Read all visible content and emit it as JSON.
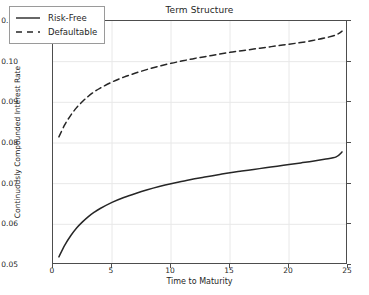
{
  "chart_data": {
    "type": "line",
    "title": "Term Structure",
    "xlabel": "Time to Maturity",
    "ylabel": "Continuously Compounded Interest Rate",
    "xlim": [
      0,
      25
    ],
    "ylim": [
      0.05,
      0.11
    ],
    "xticks": [
      "0",
      "5",
      "10",
      "15",
      "20",
      "25"
    ],
    "xtick_values": [
      0,
      5,
      10,
      15,
      20,
      25
    ],
    "yticks": [
      "0.05",
      "0.06",
      "0.07",
      "0.08",
      "0.09",
      "0.10",
      "0.11"
    ],
    "ytick_values": [
      0.05,
      0.06,
      0.07,
      0.08,
      0.09,
      0.1,
      0.11
    ],
    "grid": true,
    "legend_position": "upper left",
    "x": [
      0.5,
      1,
      1.5,
      2,
      2.5,
      3,
      3.5,
      4,
      5,
      6,
      7,
      8,
      9,
      10,
      11,
      12,
      13,
      14,
      15,
      16,
      17,
      18,
      19,
      20,
      21,
      22,
      23,
      24,
      24.5
    ],
    "series": [
      {
        "name": "Risk-Free",
        "style": "solid",
        "color": "#262626",
        "values": [
          0.052,
          0.0549,
          0.0572,
          0.0591,
          0.0606,
          0.0619,
          0.063,
          0.0639,
          0.0654,
          0.0666,
          0.0676,
          0.0685,
          0.0693,
          0.07,
          0.0706,
          0.0712,
          0.0717,
          0.0722,
          0.0727,
          0.0731,
          0.0735,
          0.0739,
          0.0743,
          0.0747,
          0.0751,
          0.0755,
          0.076,
          0.0766,
          0.0778
        ]
      },
      {
        "name": "Defaultable",
        "style": "dashed",
        "color": "#262626",
        "values": [
          0.0815,
          0.0845,
          0.0868,
          0.0887,
          0.0902,
          0.0915,
          0.0926,
          0.0935,
          0.095,
          0.0962,
          0.0972,
          0.0981,
          0.0989,
          0.0996,
          0.1002,
          0.1008,
          0.1013,
          0.1018,
          0.1023,
          0.1027,
          0.1031,
          0.1035,
          0.1039,
          0.1043,
          0.1047,
          0.1052,
          0.1058,
          0.1066,
          0.1075
        ]
      }
    ]
  },
  "legend": {
    "items": [
      {
        "label": "Risk-Free"
      },
      {
        "label": "Defaultable"
      }
    ]
  },
  "colors": {
    "line": "#262626",
    "grid": "#e8e8e8",
    "axis": "#4d4d4d",
    "background": "#ffffff"
  }
}
